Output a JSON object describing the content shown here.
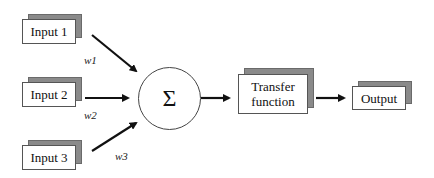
{
  "diagram": {
    "type": "perceptron-neuron-model",
    "inputs": [
      {
        "label": "Input 1",
        "weight": "w1"
      },
      {
        "label": "Input 2",
        "weight": "w2"
      },
      {
        "label": "Input 3",
        "weight": "w3"
      }
    ],
    "summation": {
      "symbol": "Σ"
    },
    "transfer": {
      "label_line1": "Transfer",
      "label_line2": "function"
    },
    "output": {
      "label": "Output"
    },
    "colors": {
      "shadow": "#8a8a8a",
      "border": "#555555",
      "arrow": "#111111",
      "background": "#ffffff"
    }
  }
}
